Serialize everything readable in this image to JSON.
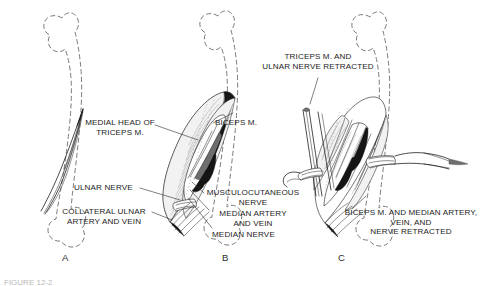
{
  "figure": {
    "background_color": "#ffffff",
    "ink_color": "#111111",
    "outline_color": "#7a7a7a",
    "caption": "FIGURE 12-2"
  },
  "panels": [
    {
      "id": "A",
      "letter": "A",
      "description": "Dashed humerus outline with medial intermuscular septum incision line"
    },
    {
      "id": "B",
      "letter": "B",
      "description": "Medial arm dissection exposing triceps, biceps, and neurovascular bundle"
    },
    {
      "id": "C",
      "letter": "C",
      "description": "Deep exposure with triceps, ulnar nerve, biceps and median bundle retracted"
    }
  ],
  "labels": [
    {
      "name": "medial-head-of-triceps",
      "lines": [
        "MEDIAL HEAD OF",
        "TRICEPS M."
      ],
      "text": "MEDIAL HEAD OF\nTRICEPS M.",
      "panel": "B",
      "align": "center"
    },
    {
      "name": "ulnar-nerve",
      "lines": [
        "ULNAR NERVE"
      ],
      "text": "ULNAR NERVE",
      "panel": "B",
      "align": "left"
    },
    {
      "name": "collateral-ulnar-artery-and-vein",
      "lines": [
        "COLLATERAL ULNAR",
        "ARTERY AND VEIN"
      ],
      "text": "COLLATERAL ULNAR\nARTERY AND VEIN",
      "panel": "B",
      "align": "center"
    },
    {
      "name": "biceps-m",
      "lines": [
        "BICEPS M."
      ],
      "text": "BICEPS M.",
      "panel": "B",
      "align": "left"
    },
    {
      "name": "musculocutaneous-nerve",
      "lines": [
        "MUSCULOCUTANEOUS",
        "NERVE"
      ],
      "text": "MUSCULOCUTANEOUS\nNERVE",
      "panel": "B",
      "align": "center"
    },
    {
      "name": "median-artery-and-vein",
      "lines": [
        "MEDIAN ARTERY",
        "AND VEIN"
      ],
      "text": "MEDIAN ARTERY\nAND VEIN",
      "panel": "B",
      "align": "center"
    },
    {
      "name": "median-nerve",
      "lines": [
        "MEDIAN NERVE"
      ],
      "text": "MEDIAN NERVE",
      "panel": "B",
      "align": "left"
    },
    {
      "name": "triceps-and-ulnar-nerve-retracted",
      "lines": [
        "TRICEPS M. AND",
        "ULNAR NERVE RETRACTED"
      ],
      "text": "TRICEPS M. AND\nULNAR NERVE RETRACTED",
      "panel": "C",
      "align": "center"
    },
    {
      "name": "biceps-and-median-bundle-retracted",
      "lines": [
        "BICEPS M. AND MEDIAN ARTERY,",
        "VEIN, AND",
        "NERVE RETRACTED"
      ],
      "text": "BICEPS M. AND MEDIAN ARTERY,\nVEIN, AND\nNERVE RETRACTED",
      "panel": "C",
      "align": "center"
    }
  ]
}
